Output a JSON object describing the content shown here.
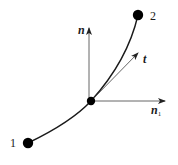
{
  "diagram": {
    "type": "curve-with-local-frame",
    "colors": {
      "curve": "#1a1a1a",
      "axes": "#555555",
      "nodes": "#000000",
      "background": "#ffffff"
    },
    "nodes": [
      {
        "id": "node-1",
        "label": "1",
        "x": 28,
        "y": 143,
        "r": 5
      },
      {
        "id": "node-mid",
        "label": "",
        "x": 91,
        "y": 101,
        "r": 4
      },
      {
        "id": "node-2",
        "label": "2",
        "x": 138,
        "y": 15,
        "r": 5
      }
    ],
    "vectors": [
      {
        "id": "n",
        "label": "n",
        "subscript": "",
        "from": [
          89,
          101
        ],
        "to": [
          89,
          28
        ]
      },
      {
        "id": "n1",
        "label": "n",
        "subscript": "1",
        "from": [
          91,
          101
        ],
        "to": [
          165,
          101
        ]
      },
      {
        "id": "t",
        "label": "t",
        "subscript": "",
        "from": [
          91,
          101
        ],
        "to": [
          138,
          53
        ]
      }
    ],
    "labels": {
      "node1": "1",
      "node2": "2",
      "normal": "n",
      "binormal": "n",
      "binormal_sub": "1",
      "tangent": "t"
    }
  }
}
